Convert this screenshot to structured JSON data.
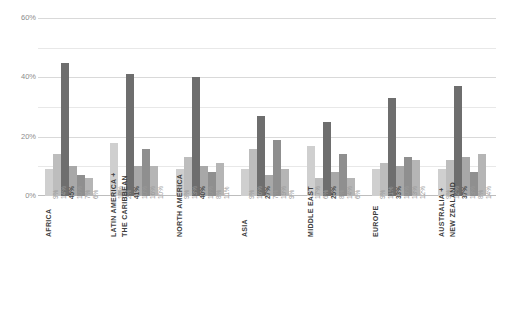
{
  "chart_data": {
    "type": "bar",
    "title": "",
    "subtitle": "",
    "xlabel": "",
    "ylabel": "",
    "ylim": [
      0,
      60
    ],
    "yticks": [
      "0%",
      "20%",
      "40%",
      "60%"
    ],
    "ytick_values": [
      0,
      20,
      40,
      60
    ],
    "minor_gridlines": [
      10,
      30,
      50
    ],
    "grid": true,
    "legend": "none",
    "categories": [
      "AFRICA",
      "LATIN AMERICA + THE CARIBBEAN",
      "NORTH AMERICA",
      "ASIA",
      "MIDDLE EAST",
      "EUROPE",
      "AUSTRALIA + NEW ZEALAND"
    ],
    "series": [
      {
        "name": "series-1",
        "color": "#cfcfcf",
        "values": [
          9,
          18,
          9,
          9,
          17,
          9,
          9
        ]
      },
      {
        "name": "series-2",
        "color": "#bdbdbd",
        "values": [
          14,
          2,
          13,
          16,
          6,
          11,
          12
        ]
      },
      {
        "name": "series-3",
        "color": "#6e6e6e",
        "values": [
          45,
          41,
          40,
          27,
          25,
          33,
          37
        ]
      },
      {
        "name": "series-4",
        "color": "#a8a8a8",
        "values": [
          10,
          10,
          10,
          7,
          8,
          10,
          13
        ]
      },
      {
        "name": "series-5",
        "color": "#8f8f8f",
        "values": [
          7,
          16,
          8,
          19,
          14,
          13,
          8
        ]
      },
      {
        "name": "series-6",
        "color": "#b5b5b5",
        "values": [
          6,
          10,
          11,
          9,
          6,
          12,
          14
        ]
      }
    ],
    "value_labels": {
      "AFRICA": [
        "9%",
        "14%",
        "45%",
        "10%",
        "7%",
        "6%"
      ],
      "LATIN AMERICA + THE CARIBBEAN": [
        "18%",
        "2%",
        "41%",
        "10%",
        "16%",
        "10%"
      ],
      "NORTH AMERICA": [
        "9%",
        "13%",
        "40%",
        "10%",
        "8%",
        "11%"
      ],
      "ASIA": [
        "9%",
        "16%",
        "27%",
        "7%",
        "19%",
        "9%"
      ],
      "MIDDLE EAST": [
        "17%",
        "6%",
        "25%",
        "8%",
        "14%",
        "6%"
      ],
      "EUROPE": [
        "9%",
        "11%",
        "33%",
        "10%",
        "13%",
        "12%"
      ],
      "AUSTRALIA + NEW ZEALAND": [
        "9%",
        "12%",
        "37%",
        "13%",
        "8%",
        "14%"
      ]
    },
    "category_label_lines": {
      "AFRICA": [
        "AFRICA"
      ],
      "LATIN AMERICA + THE CARIBBEAN": [
        "LATIN AMERICA +",
        "THE CARIBBEAN"
      ],
      "NORTH AMERICA": [
        "NORTH AMERICA"
      ],
      "ASIA": [
        "ASIA"
      ],
      "MIDDLE EAST": [
        "MIDDLE EAST"
      ],
      "EUROPE": [
        "EUROPE"
      ],
      "AUSTRALIA + NEW ZEALAND": [
        "AUSTRALIA +",
        "NEW ZEALAND"
      ]
    }
  },
  "colors": {
    "background": "#ffffff",
    "gridline": "#d9d9d9",
    "gridline_minor": "#e8e8e8",
    "axis": "#bdbdbd",
    "tick_text": "#8c8c8c",
    "value_text": "#9a9a9a",
    "category_text": "#3d3d3d"
  }
}
